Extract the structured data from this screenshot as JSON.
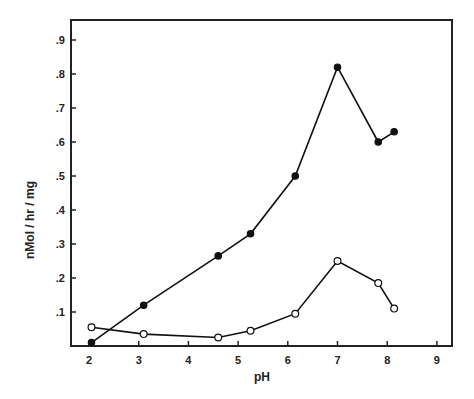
{
  "chart_data": {
    "type": "line",
    "title": "",
    "xlabel": "pH",
    "ylabel": "nMol / hr / mg",
    "xlim": [
      1.65,
      9.3
    ],
    "ylim": [
      0,
      0.96
    ],
    "grid": false,
    "legend": null,
    "x_ticks": [
      2,
      3,
      4,
      5,
      6,
      7,
      8,
      9
    ],
    "x_tick_labels": [
      "2",
      "3",
      "4",
      "5",
      "6",
      "7",
      "8",
      "9"
    ],
    "y_ticks": [
      0.1,
      0.2,
      0.3,
      0.4,
      0.5,
      0.6,
      0.7,
      0.8,
      0.9
    ],
    "y_tick_labels": [
      ".1",
      ".2",
      ".3",
      ".4",
      ".5",
      ".6",
      ".7",
      ".8",
      ".9"
    ],
    "series": [
      {
        "name": "filled circles",
        "marker": "filled-circle",
        "x": [
          2.05,
          3.1,
          4.6,
          5.25,
          6.15,
          7.0,
          7.82,
          8.14
        ],
        "values": [
          0.01,
          0.12,
          0.265,
          0.33,
          0.5,
          0.82,
          0.6,
          0.63
        ]
      },
      {
        "name": "open circles",
        "marker": "open-circle",
        "x": [
          2.05,
          3.1,
          4.6,
          5.25,
          6.15,
          7.0,
          7.82,
          8.14
        ],
        "values": [
          0.055,
          0.035,
          0.025,
          0.045,
          0.095,
          0.25,
          0.185,
          0.11
        ]
      }
    ]
  }
}
